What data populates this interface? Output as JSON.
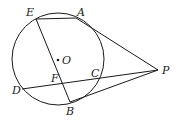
{
  "figure": {
    "type": "geometry",
    "colors": {
      "stroke": "#1a1a1a",
      "background": "#ffffff"
    },
    "circle": {
      "center": "O",
      "cx": 58,
      "cy": 59,
      "r": 46
    },
    "points": {
      "A": {
        "x": 76,
        "y": 18
      },
      "B": {
        "x": 70,
        "y": 102
      },
      "C": {
        "x": 96,
        "y": 78
      },
      "D": {
        "x": 22,
        "y": 89
      },
      "E": {
        "x": 36,
        "y": 19
      },
      "F": {
        "x": 62,
        "y": 84
      },
      "O": {
        "x": 58,
        "y": 60
      },
      "P": {
        "x": 158,
        "y": 70
      }
    },
    "segments": [
      [
        "E",
        "A"
      ],
      [
        "E",
        "B"
      ],
      [
        "A",
        "P"
      ],
      [
        "B",
        "P"
      ],
      [
        "D",
        "P"
      ]
    ],
    "labels": {
      "A": "A",
      "B": "B",
      "C": "C",
      "D": "D",
      "E": "E",
      "F": "F",
      "O": "O",
      "P": "P"
    }
  }
}
